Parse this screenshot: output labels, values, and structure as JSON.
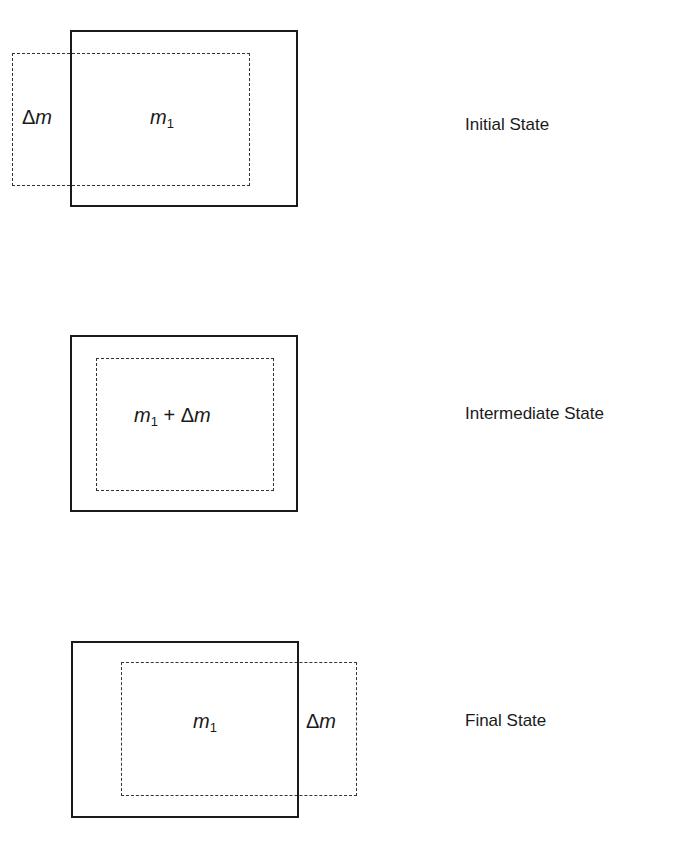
{
  "diagram": {
    "states": [
      {
        "label": "Initial State",
        "outside_label": "Δm",
        "inside_label_var": "m",
        "inside_label_sub": "1"
      },
      {
        "label": "Intermediate State",
        "inside_label_var": "m",
        "inside_label_sub": "1",
        "operator": "+",
        "delta_symbol": "Δ",
        "delta_var": "m"
      },
      {
        "label": "Final State",
        "outside_label": "Δm",
        "inside_label_var": "m",
        "inside_label_sub": "1"
      }
    ],
    "colors": {
      "line": "#1a1a1a",
      "background": "#ffffff"
    }
  }
}
